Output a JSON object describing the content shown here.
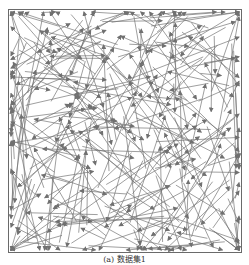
{
  "figure": {
    "caption": "(a) 数据集1",
    "frame": {
      "x": 8,
      "y": 9,
      "width": 234,
      "height": 244,
      "border_color": "#6a6a6a"
    },
    "arrow_color": "#707070",
    "arrow_count": 320,
    "seed": 17
  }
}
